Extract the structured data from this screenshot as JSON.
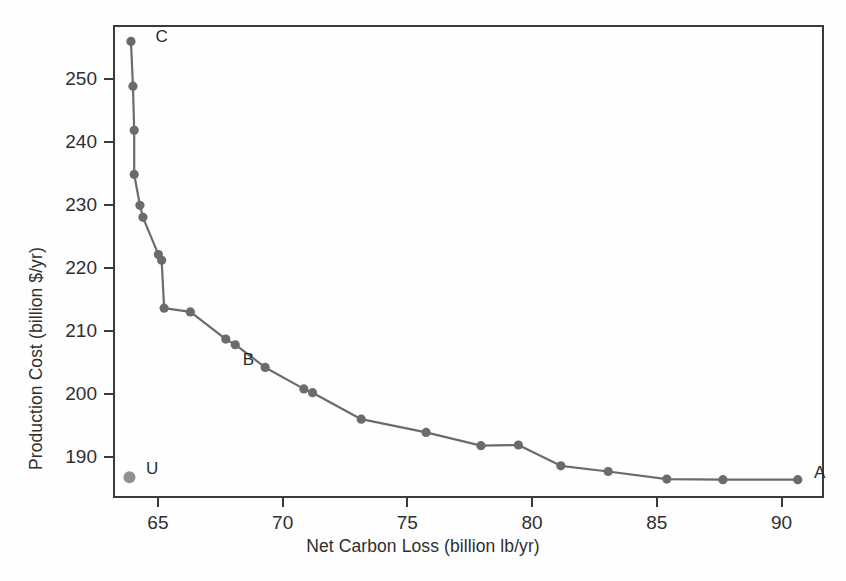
{
  "chart_data": {
    "type": "scatter",
    "title": "",
    "xlabel": "Net Carbon Loss (billion lb/yr)",
    "ylabel": "Production Cost (billion $/yr)",
    "xlim": [
      63.2,
      91.7
    ],
    "ylim": [
      183.5,
      258.5
    ],
    "xticks": [
      65,
      70,
      75,
      80,
      85,
      90
    ],
    "xticklabels": [
      "65",
      "70",
      "75",
      "80",
      "85",
      "90"
    ],
    "yticks": [
      190,
      200,
      210,
      220,
      230,
      240,
      250
    ],
    "yticklabels": [
      "190",
      "200",
      "210",
      "220",
      "230",
      "240",
      "250"
    ],
    "grid": false,
    "legend": "none",
    "series": [
      {
        "name": "pareto-frontier",
        "style": "line-with-markers",
        "color": "#6b6b6b",
        "x": [
          63.92,
          64.0,
          64.05,
          64.05,
          64.28,
          64.4,
          65.02,
          65.15,
          65.25,
          66.3,
          67.72,
          68.1,
          69.3,
          70.85,
          71.2,
          73.15,
          75.75,
          77.95,
          79.45,
          81.15,
          83.05,
          85.4,
          87.65,
          90.65
        ],
        "y": [
          255.9,
          248.8,
          241.8,
          234.8,
          229.9,
          228.0,
          222.1,
          221.2,
          213.6,
          213.0,
          208.7,
          207.8,
          204.2,
          200.8,
          200.2,
          196.0,
          193.9,
          191.8,
          191.9,
          188.6,
          187.7,
          186.5,
          186.4,
          186.4
        ]
      },
      {
        "name": "unconstrained-point",
        "style": "marker-only",
        "color": "#909090",
        "x": [
          63.86
        ],
        "y": [
          186.8
        ]
      }
    ],
    "annotations": [
      {
        "text": "C",
        "x": 64.9,
        "y": 256.8
      },
      {
        "text": "B",
        "x": 68.4,
        "y": 205.6
      },
      {
        "text": "U",
        "x": 64.52,
        "y": 188.3
      },
      {
        "text": "A",
        "x": 91.3,
        "y": 187.6
      }
    ]
  }
}
